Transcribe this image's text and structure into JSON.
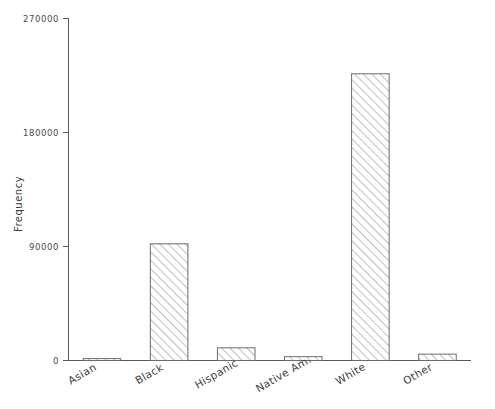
{
  "chart_data": {
    "type": "bar",
    "title": "",
    "xlabel": "",
    "ylabel": "Frequency",
    "categories": [
      "Asian",
      "Black",
      "Hispanic",
      "Native Am.",
      "White",
      "Other"
    ],
    "values": [
      1500,
      92000,
      10000,
      3000,
      226000,
      5000
    ],
    "ylim": [
      0,
      270000
    ],
    "yticks": [
      0,
      90000,
      180000,
      270000
    ],
    "ytick_labels": [
      "0",
      "90000",
      "180000",
      "270000"
    ],
    "grid": false,
    "legend": null,
    "bar_style": {
      "fill_pattern": "diagonal-hatch-45",
      "edge_color": "#6b6b6b",
      "fill_color": "#ffffff",
      "hatch_color": "#8c8c8c"
    },
    "xtick_label_rotation": 30
  },
  "axes": {
    "y_axis_title": "Frequency",
    "y_tick_0": "0",
    "y_tick_1": "90000",
    "y_tick_2": "180000",
    "y_tick_3": "270000"
  },
  "bars": [
    {
      "label": "Asian",
      "value": 1500
    },
    {
      "label": "Black",
      "value": 92000
    },
    {
      "label": "Hispanic",
      "value": 10000
    },
    {
      "label": "Native Am.",
      "value": 3000
    },
    {
      "label": "White",
      "value": 226000
    },
    {
      "label": "Other",
      "value": 5000
    }
  ]
}
